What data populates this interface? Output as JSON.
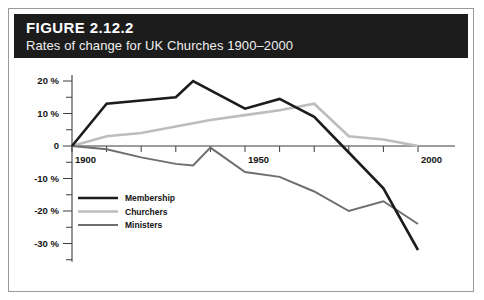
{
  "figure": {
    "label": "FIGURE 2.12.2",
    "subtitle": "Rates of change for UK Churches 1900–2000",
    "title_bar_color": "#1c1c1c",
    "frame_color": "#9a9a9a",
    "background_color": "#ffffff"
  },
  "chart_data": {
    "type": "line",
    "title": "Rates of change for UK Churches 1900–2000",
    "subtitle": "FIGURE 2.12.2",
    "xlabel": "",
    "ylabel": "",
    "x": [
      1900,
      1910,
      1920,
      1930,
      1935,
      1940,
      1950,
      1960,
      1970,
      1980,
      1990,
      2000
    ],
    "xlim": [
      1895,
      2005
    ],
    "ylim": [
      -35,
      22
    ],
    "yticks": [
      20,
      10,
      0,
      -10,
      -20,
      -30
    ],
    "ytick_labels": [
      "20 %",
      "10 %",
      "0",
      "-10 %",
      "-20 %",
      "-30 %"
    ],
    "yminor_ticks": [
      15,
      5,
      -5,
      -15,
      -25,
      -35
    ],
    "xticks": [
      1900,
      1910,
      1920,
      1930,
      1940,
      1950,
      1960,
      1970,
      1980,
      1990,
      2000
    ],
    "xtick_labels_shown": [
      {
        "x": 1900,
        "label": "1900"
      },
      {
        "x": 1950,
        "label": "1950"
      },
      {
        "x": 2000,
        "label": "2000"
      }
    ],
    "grid": false,
    "legend_position": "inside-lower-left",
    "series": [
      {
        "name": "Membership",
        "color": "#1c1c1c",
        "width": 2.6,
        "x": [
          1900,
          1910,
          1920,
          1930,
          1935,
          1950,
          1960,
          1970,
          1980,
          1990,
          2000
        ],
        "values": [
          0,
          13,
          14,
          15,
          20,
          11.5,
          14.5,
          9,
          -2,
          -13,
          -32
        ]
      },
      {
        "name": "Churchers",
        "color": "#bdbdbd",
        "width": 2.6,
        "x": [
          1900,
          1910,
          1920,
          1930,
          1940,
          1950,
          1960,
          1970,
          1980,
          1990,
          2000
        ],
        "values": [
          0,
          3,
          4,
          6,
          8,
          9.5,
          11,
          13,
          3,
          2,
          0
        ]
      },
      {
        "name": "Ministers",
        "color": "#6e6e6e",
        "width": 2.0,
        "x": [
          1900,
          1910,
          1920,
          1930,
          1935,
          1940,
          1950,
          1960,
          1970,
          1980,
          1990,
          2000
        ],
        "values": [
          0,
          -1,
          -3.5,
          -5.5,
          -6,
          -0.5,
          -8,
          -9.5,
          -14,
          -20,
          -17,
          -24
        ]
      }
    ],
    "legend": [
      {
        "name": "Membership",
        "color": "#1c1c1c"
      },
      {
        "name": "Churchers",
        "color": "#bdbdbd"
      },
      {
        "name": "Ministers",
        "color": "#6e6e6e"
      }
    ]
  }
}
